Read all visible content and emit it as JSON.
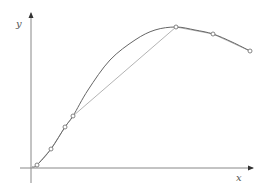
{
  "chart_data": {
    "type": "line",
    "title": "",
    "xlabel": "x",
    "ylabel": "y",
    "grid": false,
    "legend": null,
    "series": [
      {
        "name": "curve",
        "style": "smooth",
        "color": "#666666",
        "points_px": [
          [
            32,
            167
          ],
          [
            37,
            165
          ],
          [
            51,
            149
          ],
          [
            65,
            127
          ],
          [
            73,
            116
          ],
          [
            88,
            90
          ],
          [
            110,
            60
          ],
          [
            135,
            40
          ],
          [
            155,
            30
          ],
          [
            176,
            27
          ],
          [
            195,
            30
          ],
          [
            213,
            34
          ],
          [
            232,
            42
          ],
          [
            250,
            51
          ]
        ]
      },
      {
        "name": "chords",
        "style": "polyline",
        "color": "#aaaaaa",
        "points_px": [
          [
            37,
            165
          ],
          [
            51,
            149
          ],
          [
            65,
            127
          ],
          [
            73,
            116
          ],
          [
            176,
            27
          ],
          [
            213,
            34
          ],
          [
            250,
            51
          ]
        ]
      },
      {
        "name": "sample-points",
        "style": "markers",
        "marker": "open-circle",
        "color": "#777777",
        "points_px": [
          [
            37,
            165
          ],
          [
            51,
            149
          ],
          [
            65,
            127
          ],
          [
            73,
            116
          ],
          [
            176,
            27
          ],
          [
            213,
            34
          ],
          [
            250,
            51
          ]
        ]
      }
    ],
    "axes": {
      "origin_px": [
        31,
        168
      ],
      "x_axis": {
        "from_px": 20,
        "to_px": 253,
        "label": "x",
        "label_px": [
          238,
          180
        ]
      },
      "y_axis": {
        "from_px": 183,
        "to_px": 13,
        "label": "y",
        "label_px": [
          17,
          27
        ]
      }
    }
  }
}
